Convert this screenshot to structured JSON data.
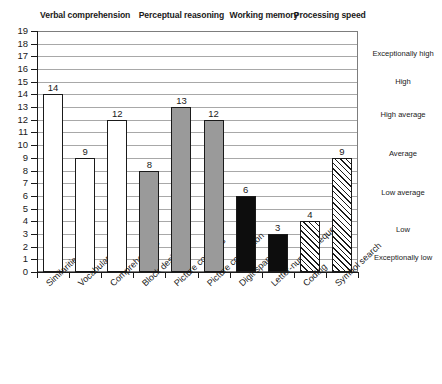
{
  "chart_data": {
    "type": "bar",
    "title": "",
    "xlabel": "",
    "ylabel": "",
    "ylim": [
      0,
      19
    ],
    "grid": true,
    "legend_position": "none",
    "categories": [
      "Similarities",
      "Vocabulary",
      "Comprehension",
      "Block design",
      "Picture concepts",
      "Picture completion",
      "Digit span",
      "Letter-number sequencing",
      "Coding",
      "Symbol search"
    ],
    "values": [
      14,
      9,
      12,
      8,
      13,
      12,
      6,
      3,
      4,
      9
    ],
    "bar_styles": [
      "white",
      "white",
      "white",
      "gray",
      "gray",
      "gray",
      "black",
      "black",
      "hatch",
      "hatch"
    ],
    "yticks": [
      19,
      18,
      17,
      16,
      15,
      14,
      13,
      12,
      11,
      10,
      9,
      8,
      7,
      6,
      5,
      4,
      3,
      2,
      1,
      0
    ],
    "groups": [
      {
        "label": "Verbal comprehension",
        "start_index": 0,
        "end_index": 2
      },
      {
        "label": "Perceptual reasoning",
        "start_index": 3,
        "end_index": 5
      },
      {
        "label": "Working memory",
        "start_index": 6,
        "end_index": 7
      },
      {
        "label": "Processing speed",
        "start_index": 8,
        "end_index": 9
      }
    ],
    "bands": [
      {
        "label": "Exceptionally high",
        "center_value": 17.2
      },
      {
        "label": "High",
        "center_value": 15.0
      },
      {
        "label": "High average",
        "center_value": 12.4
      },
      {
        "label": "Average",
        "center_value": 9.3
      },
      {
        "label": "Low average",
        "center_value": 6.2
      },
      {
        "label": "Low",
        "center_value": 3.3
      },
      {
        "label": "Exceptionally low",
        "center_value": 1.1
      }
    ],
    "colors": {
      "white_bar": "#ffffff",
      "gray_bar": "#9a9a9a",
      "black_bar": "#0d0d0d",
      "hatch_bar": "#ffffff",
      "axis": "#1a1a1a",
      "gridline": "#a8a8a8",
      "frame": "#7d7d7d",
      "background": "#ffffff"
    }
  }
}
